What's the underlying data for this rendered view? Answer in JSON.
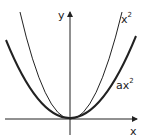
{
  "diagram": {
    "axes": {
      "x_label": "x",
      "y_label": "y"
    },
    "curves": [
      {
        "name": "x^2",
        "label_base": "x",
        "label_exp": "2",
        "stroke_width": 1
      },
      {
        "name": "ax^2",
        "label_base": "ax",
        "label_exp": "2",
        "stroke_width": 2
      }
    ],
    "colors": {
      "stroke": "#222222",
      "background": "#ffffff"
    }
  }
}
